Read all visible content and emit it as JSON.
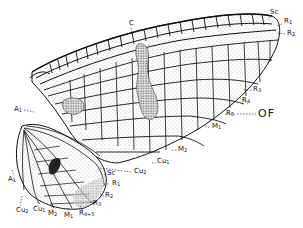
{
  "figure": {
    "colors": {
      "line": "#111111",
      "stipple": "#9a9a9a",
      "dark_patch": "#2a2a2a",
      "background": "#ffffff"
    }
  },
  "forewing": {
    "labels": [
      {
        "id": "C",
        "text": "C",
        "x": 129,
        "y": 20
      },
      {
        "id": "Sc",
        "text": "Sc",
        "x": 270,
        "y": 11
      },
      {
        "id": "R1",
        "base": "R",
        "sub": "1",
        "x": 284,
        "y": 20
      },
      {
        "id": "R2",
        "base": "R",
        "sub": "2",
        "x": 287,
        "y": 32
      },
      {
        "id": "R3",
        "base": "R",
        "sub": "3",
        "x": 246,
        "y": 87
      },
      {
        "id": "R4",
        "base": "R",
        "sub": "4",
        "x": 242,
        "y": 98
      },
      {
        "id": "R5",
        "base": "R",
        "sub": "5",
        "x": 226,
        "y": 112
      },
      {
        "id": "M1",
        "base": "M",
        "sub": "1",
        "x": 212,
        "y": 124
      },
      {
        "id": "M2",
        "base": "M",
        "sub": "2",
        "x": 178,
        "y": 147
      },
      {
        "id": "Cu1",
        "base": "Cu",
        "sub": "1",
        "x": 157,
        "y": 161
      },
      {
        "id": "Cu2",
        "base": "Cu",
        "sub": "2",
        "x": 134,
        "y": 168
      },
      {
        "id": "A1",
        "base": "A",
        "sub": "1",
        "x": 14,
        "y": 107
      }
    ],
    "annotation": {
      "text": "OF",
      "x": 258,
      "y": 109
    }
  },
  "hindwing": {
    "labels": [
      {
        "id": "Sc",
        "text": "Sc",
        "x": 107,
        "y": 171
      },
      {
        "id": "R1",
        "base": "R",
        "sub": "1",
        "x": 112,
        "y": 180
      },
      {
        "id": "R2",
        "base": "R",
        "sub": "2",
        "x": 105,
        "y": 193
      },
      {
        "id": "R3",
        "base": "R",
        "sub": "3",
        "x": 93,
        "y": 201
      },
      {
        "id": "R4+5",
        "base": "R",
        "sub": "4+5",
        "x": 79,
        "y": 210
      },
      {
        "id": "M1",
        "base": "M",
        "sub": "1",
        "x": 66,
        "y": 212
      },
      {
        "id": "M2",
        "base": "M",
        "sub": "2",
        "x": 49,
        "y": 210
      },
      {
        "id": "Cu1",
        "base": "Cu",
        "sub": "1",
        "x": 35,
        "y": 205
      },
      {
        "id": "Cu2",
        "base": "Cu",
        "sub": "2",
        "x": 17,
        "y": 207
      },
      {
        "id": "A1",
        "base": "A",
        "sub": "1",
        "x": 8,
        "y": 176
      }
    ]
  }
}
